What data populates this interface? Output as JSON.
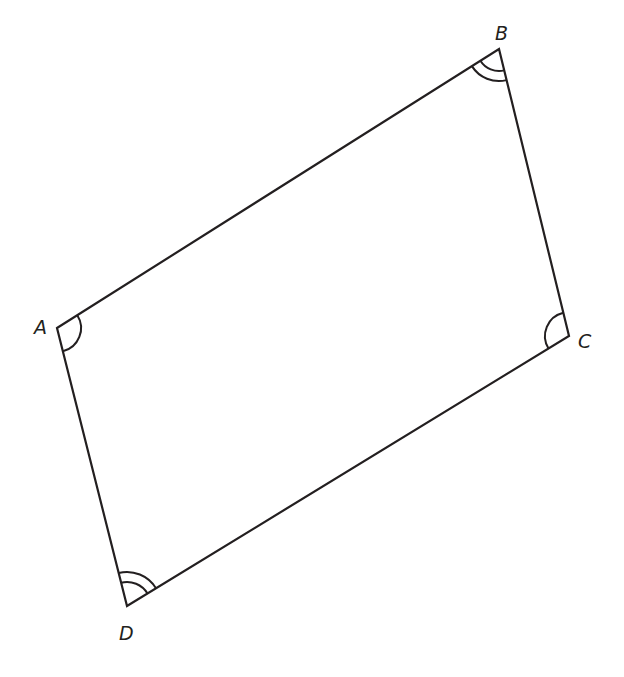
{
  "diagram": {
    "type": "quadrilateral",
    "shape": "parallelogram",
    "stroke_color": "#231f20",
    "background": "#ffffff",
    "vertices": {
      "A": {
        "label": "A",
        "x": 57,
        "y": 328,
        "angle_marks": 1
      },
      "B": {
        "label": "B",
        "x": 499,
        "y": 49,
        "angle_marks": 2
      },
      "C": {
        "label": "C",
        "x": 569,
        "y": 336,
        "angle_marks": 1
      },
      "D": {
        "label": "D",
        "x": 127,
        "y": 606,
        "angle_marks": 2
      }
    },
    "edges": [
      "AB",
      "BC",
      "CD",
      "DA"
    ],
    "angle_marking_note": "Single arcs at A and C; double arcs at B and D (opposite angles equal)"
  }
}
